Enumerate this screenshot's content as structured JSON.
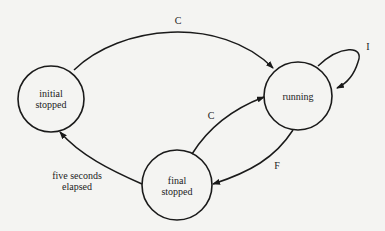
{
  "states": [
    {
      "id": "initial",
      "label_line1": "initial",
      "label_line2": "stopped"
    },
    {
      "id": "running",
      "label_line1": "running",
      "label_line2": ""
    },
    {
      "id": "final",
      "label_line1": "final",
      "label_line2": "stopped"
    }
  ],
  "transitions": [
    {
      "from": "initial",
      "to": "running",
      "label": "C"
    },
    {
      "from": "running",
      "to": "running",
      "label": "I"
    },
    {
      "from": "final",
      "to": "running",
      "label": "C"
    },
    {
      "from": "running",
      "to": "final",
      "label": "F"
    },
    {
      "from": "final",
      "to": "initial",
      "label_line1": "five seconds",
      "label_line2": "elapsed"
    }
  ],
  "colors": {
    "stroke": "#1a1a1a",
    "background": "#f4f4f2"
  }
}
